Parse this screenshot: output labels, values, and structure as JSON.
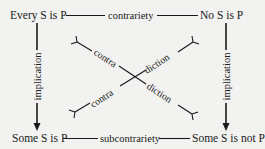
{
  "corners": {
    "top_left": "Every S is P",
    "top_right": "No S is P",
    "bottom_left": "Some S is P",
    "bottom_right": "Some S is not P"
  },
  "relations": {
    "top": "contrariety",
    "bottom": "subcontrariety",
    "left": "implication",
    "right": "implication",
    "diagonal_part1": "contra",
    "diagonal_part2": "diction"
  },
  "diagonals": [
    {
      "from": "Every S is P",
      "to": "Some S is not P",
      "label": [
        "contra",
        "diction"
      ]
    },
    {
      "from": "No S is P",
      "to": "Some S is P",
      "label": [
        "diction",
        "contra"
      ]
    }
  ],
  "colors": {
    "background": "#f2f2f0",
    "ink": "#1a1a1a"
  }
}
